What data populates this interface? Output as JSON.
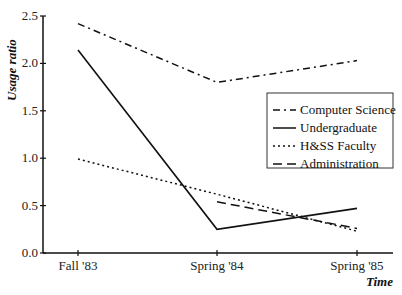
{
  "chart_data": {
    "type": "line",
    "title": "",
    "xlabel": "Time",
    "ylabel": "Usage ratio",
    "categories": [
      "Fall '83",
      "Spring '84",
      "Spring '85"
    ],
    "ylim": [
      0,
      2.5
    ],
    "yticks": [
      "0.0",
      "0.5",
      "1.0",
      "1.5",
      "2.0",
      "2.5"
    ],
    "grid": false,
    "legend_position": "right-middle",
    "series": [
      {
        "name": "Computer Science",
        "style": "dash-dot",
        "values": [
          2.42,
          1.8,
          2.03
        ]
      },
      {
        "name": "Undergraduate",
        "style": "solid",
        "values": [
          2.14,
          0.25,
          0.47
        ]
      },
      {
        "name": "H&SS Faculty",
        "style": "dotted",
        "values": [
          0.99,
          0.62,
          0.23
        ]
      },
      {
        "name": "Administration",
        "style": "dashed",
        "values": [
          null,
          0.54,
          0.26
        ]
      }
    ]
  },
  "colors": {
    "line": "#111111",
    "background": "#ffffff"
  }
}
